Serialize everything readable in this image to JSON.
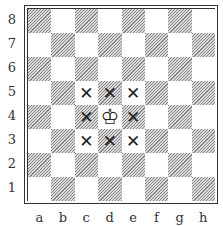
{
  "diagram": {
    "title": "",
    "ranks": [
      "8",
      "7",
      "6",
      "5",
      "4",
      "3",
      "2",
      "1"
    ],
    "files": [
      "a",
      "b",
      "c",
      "d",
      "e",
      "f",
      "g",
      "h"
    ],
    "pieces": [
      {
        "square": "d4",
        "piece": "white-king",
        "glyph": "♔"
      }
    ],
    "marked_squares": [
      "c5",
      "d5",
      "e5",
      "c4",
      "e4",
      "c3",
      "d3",
      "e3"
    ],
    "mark_glyph": "✕",
    "colors": {
      "dark_square": "#8a8a8a",
      "light_square": "#ffffff",
      "border": "#333333"
    }
  }
}
